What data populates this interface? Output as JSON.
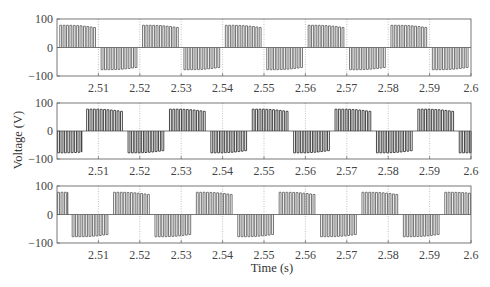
{
  "chart_data": {
    "type": "line",
    "title": "",
    "xlabel": "Time (s)",
    "ylabel": "Voltage (V)",
    "xlim": [
      2.5,
      2.6
    ],
    "ylim": [
      -100,
      100
    ],
    "grid": true,
    "grid_style": "dotted vertical at x ticks",
    "x_ticks": [
      2.51,
      2.52,
      2.53,
      2.54,
      2.55,
      2.56,
      2.57,
      2.58,
      2.59,
      2.6
    ],
    "x_tick_labels": [
      "2.51",
      "2.52",
      "2.53",
      "2.54",
      "2.55",
      "2.56",
      "2.57",
      "2.58",
      "2.59",
      "2.6"
    ],
    "y_ticks": [
      100,
      0,
      -100
    ],
    "y_tick_labels": [
      "100",
      "0",
      "−100"
    ],
    "waveform": {
      "description": "PWM phase voltage, pulse train within sinusoid-like envelope",
      "fundamental_period_s": 0.02,
      "amplitude_V": 78,
      "pulses_per_half_cycle": 11,
      "active_fraction_of_half_cycle": 0.9
    },
    "series": [
      {
        "name": "Phase A",
        "panel": 1,
        "phase_offset_s": 0.0005,
        "positive_intervals": [
          [
            2.5005,
            2.5095
          ],
          [
            2.5205,
            2.5295
          ],
          [
            2.5405,
            2.5495
          ],
          [
            2.5605,
            2.5695
          ],
          [
            2.5805,
            2.5895
          ]
        ],
        "negative_intervals": [
          [
            2.5105,
            2.5195
          ],
          [
            2.5305,
            2.5395
          ],
          [
            2.5505,
            2.5595
          ],
          [
            2.5705,
            2.5795
          ],
          [
            2.5905,
            2.5995
          ]
        ]
      },
      {
        "name": "Phase B",
        "panel": 2,
        "phase_offset_s": 0.007,
        "positive_intervals": [
          [
            2.507,
            2.516
          ],
          [
            2.527,
            2.536
          ],
          [
            2.547,
            2.556
          ],
          [
            2.567,
            2.576
          ],
          [
            2.587,
            2.596
          ]
        ],
        "negative_intervals": [
          [
            2.5,
            2.506
          ],
          [
            2.517,
            2.526
          ],
          [
            2.537,
            2.546
          ],
          [
            2.557,
            2.566
          ],
          [
            2.577,
            2.586
          ],
          [
            2.597,
            2.6
          ]
        ]
      },
      {
        "name": "Phase C",
        "panel": 3,
        "phase_offset_s": 0.0135,
        "positive_intervals": [
          [
            2.5,
            2.5025
          ],
          [
            2.5135,
            2.5225
          ],
          [
            2.5335,
            2.5425
          ],
          [
            2.5535,
            2.5625
          ],
          [
            2.5735,
            2.5825
          ],
          [
            2.5935,
            2.6
          ]
        ],
        "negative_intervals": [
          [
            2.5035,
            2.5125
          ],
          [
            2.5235,
            2.5325
          ],
          [
            2.5435,
            2.5525
          ],
          [
            2.5635,
            2.5725
          ],
          [
            2.5835,
            2.5925
          ]
        ]
      }
    ],
    "panels": [
      {
        "id": 1,
        "top": 19,
        "bottom": 76
      },
      {
        "id": 2,
        "top": 103,
        "bottom": 159
      },
      {
        "id": 3,
        "top": 186,
        "bottom": 243
      }
    ],
    "layout": {
      "left": 57,
      "right": 471,
      "xlabel_y": 272,
      "ylabel_x": 22,
      "ylabel_y": 140
    }
  }
}
